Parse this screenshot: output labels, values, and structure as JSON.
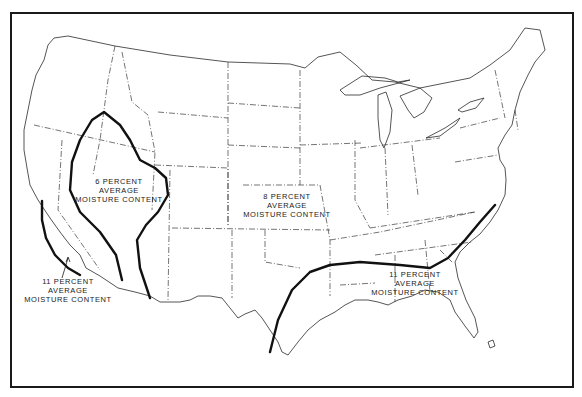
{
  "map": {
    "subject": "Contiguous United States",
    "description": "Recommended average moisture content zones for interior-use wood",
    "zones": [
      {
        "id": "zone-6",
        "percent": "6",
        "lines": [
          "6 PERCENT",
          "AVERAGE",
          "MOISTURE CONTENT"
        ],
        "region": "Southwest arid interior"
      },
      {
        "id": "zone-8",
        "percent": "8",
        "lines": [
          "8 PERCENT",
          "AVERAGE",
          "MOISTURE CONTENT"
        ],
        "region": "Most of the country"
      },
      {
        "id": "zone-11-west",
        "percent": "11",
        "lines": [
          "11 PERCENT",
          "AVERAGE",
          "MOISTURE CONTENT"
        ],
        "region": "Southern California coast"
      },
      {
        "id": "zone-11-southeast",
        "percent": "11",
        "lines": [
          "11 PERCENT",
          "AVERAGE",
          "MOISTURE CONTENT"
        ],
        "region": "Gulf and South Atlantic coast"
      }
    ],
    "colors": {
      "line": "#111111",
      "background": "#ffffff",
      "border": "#3a3a3a"
    }
  }
}
